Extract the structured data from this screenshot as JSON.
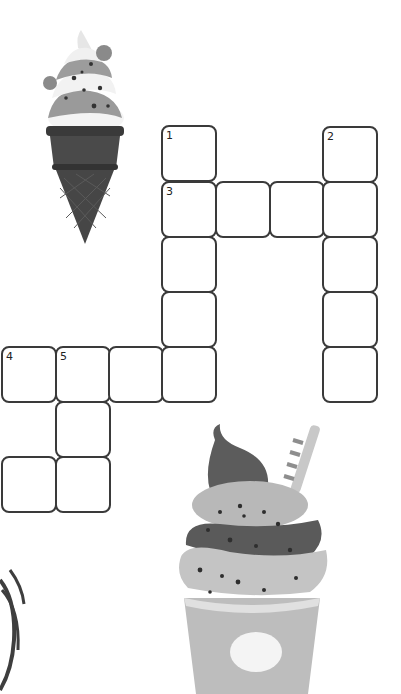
{
  "puzzle": {
    "type": "crossword",
    "cell_size_px": 54,
    "colors": {
      "cell_border": "#3a3a3a",
      "cell_fill": "#ffffff",
      "background": "#ffffff"
    },
    "cells": [
      {
        "id": "r0c3",
        "x": 161,
        "y": 125,
        "number": "1"
      },
      {
        "id": "r0c6",
        "x": 322,
        "y": 126,
        "number": "2"
      },
      {
        "id": "r1c3",
        "x": 161,
        "y": 181,
        "number": "3"
      },
      {
        "id": "r1c4",
        "x": 215,
        "y": 181,
        "number": ""
      },
      {
        "id": "r1c5",
        "x": 269,
        "y": 181,
        "number": ""
      },
      {
        "id": "r1c6",
        "x": 322,
        "y": 181,
        "number": ""
      },
      {
        "id": "r2c3",
        "x": 161,
        "y": 236,
        "number": ""
      },
      {
        "id": "r2c6",
        "x": 322,
        "y": 236,
        "number": ""
      },
      {
        "id": "r3c3",
        "x": 161,
        "y": 291,
        "number": ""
      },
      {
        "id": "r3c6",
        "x": 322,
        "y": 291,
        "number": ""
      },
      {
        "id": "r4c0",
        "x": 1,
        "y": 346,
        "number": "4"
      },
      {
        "id": "r4c1",
        "x": 55,
        "y": 346,
        "number": "5"
      },
      {
        "id": "r4c2",
        "x": 108,
        "y": 346,
        "number": ""
      },
      {
        "id": "r4c3",
        "x": 161,
        "y": 346,
        "number": ""
      },
      {
        "id": "r4c6",
        "x": 322,
        "y": 346,
        "number": ""
      },
      {
        "id": "r5c1",
        "x": 55,
        "y": 401,
        "number": ""
      },
      {
        "id": "r6c0",
        "x": 1,
        "y": 456,
        "number": ""
      },
      {
        "id": "r6c1",
        "x": 55,
        "y": 456,
        "number": ""
      }
    ]
  },
  "decorations": {
    "ice_cream_cone": "ice-cream-cone-illustration",
    "cupcake_cup": "ice-cream-cup-illustration",
    "swirl": "swirl-lines-illustration"
  }
}
